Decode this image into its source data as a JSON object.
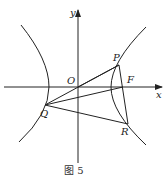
{
  "figure": {
    "caption": "图 5",
    "axes": {
      "x_label": "x",
      "y_label": "y",
      "origin_label": "O"
    },
    "points": {
      "P": {
        "label": "P"
      },
      "F": {
        "label": "F"
      },
      "Q": {
        "label": "Q"
      },
      "R": {
        "label": "R"
      }
    },
    "colors": {
      "stroke": "#222222",
      "background": "#ffffff"
    }
  }
}
